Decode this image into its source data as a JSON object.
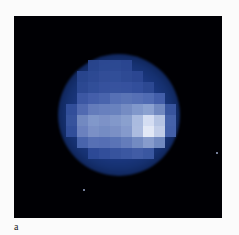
{
  "figure": {
    "panel_label": "a",
    "colors": {
      "background": "#000004",
      "disk_base": "#1d3a86",
      "band": "#7f95c9",
      "bright_spot": "#eef3ff",
      "page": "#fbfbfb"
    },
    "band_pixels": [
      {
        "x": 77,
        "y": 93,
        "c": "#3f5aa6"
      },
      {
        "x": 88,
        "y": 93,
        "c": "#4862ac"
      },
      {
        "x": 99,
        "y": 93,
        "c": "#4d67b0"
      },
      {
        "x": 110,
        "y": 93,
        "c": "#5b74b8"
      },
      {
        "x": 121,
        "y": 93,
        "c": "#5f78ba"
      },
      {
        "x": 132,
        "y": 93,
        "c": "#5b74b8"
      },
      {
        "x": 143,
        "y": 93,
        "c": "#5570b6"
      },
      {
        "x": 154,
        "y": 93,
        "c": "#4662ac"
      },
      {
        "x": 66,
        "y": 104,
        "c": "#34509c"
      },
      {
        "x": 77,
        "y": 104,
        "c": "#566fb4"
      },
      {
        "x": 88,
        "y": 104,
        "c": "#6a81bf"
      },
      {
        "x": 99,
        "y": 104,
        "c": "#6f86c2"
      },
      {
        "x": 110,
        "y": 104,
        "c": "#7088c2"
      },
      {
        "x": 121,
        "y": 104,
        "c": "#7d93c8"
      },
      {
        "x": 132,
        "y": 104,
        "c": "#8aa0d0"
      },
      {
        "x": 143,
        "y": 104,
        "c": "#95aad6"
      },
      {
        "x": 154,
        "y": 104,
        "c": "#7890c6"
      },
      {
        "x": 165,
        "y": 104,
        "c": "#3c58a2"
      },
      {
        "x": 66,
        "y": 115,
        "c": "#3a56a0"
      },
      {
        "x": 77,
        "y": 115,
        "c": "#7a90c6"
      },
      {
        "x": 88,
        "y": 115,
        "c": "#8a9fcf"
      },
      {
        "x": 99,
        "y": 115,
        "c": "#8599cc"
      },
      {
        "x": 110,
        "y": 115,
        "c": "#8b9fcf"
      },
      {
        "x": 121,
        "y": 115,
        "c": "#94a8d4"
      },
      {
        "x": 132,
        "y": 115,
        "c": "#b6c6e6"
      },
      {
        "x": 143,
        "y": 115,
        "c": "#e4ecfb"
      },
      {
        "x": 154,
        "y": 115,
        "c": "#c2d0ec"
      },
      {
        "x": 165,
        "y": 115,
        "c": "#4a66ae"
      },
      {
        "x": 66,
        "y": 126,
        "c": "#34509c"
      },
      {
        "x": 77,
        "y": 126,
        "c": "#7288c3"
      },
      {
        "x": 88,
        "y": 126,
        "c": "#8398cb"
      },
      {
        "x": 99,
        "y": 126,
        "c": "#7d93c8"
      },
      {
        "x": 110,
        "y": 126,
        "c": "#8397ca"
      },
      {
        "x": 121,
        "y": 126,
        "c": "#8ea2d1"
      },
      {
        "x": 132,
        "y": 126,
        "c": "#b8c7e6"
      },
      {
        "x": 143,
        "y": 126,
        "c": "#f3f7ff"
      },
      {
        "x": 154,
        "y": 126,
        "c": "#cfdaf1"
      },
      {
        "x": 165,
        "y": 126,
        "c": "#4864ac"
      },
      {
        "x": 77,
        "y": 137,
        "c": "#4d68b0"
      },
      {
        "x": 88,
        "y": 137,
        "c": "#5c75b8"
      },
      {
        "x": 99,
        "y": 137,
        "c": "#5a73b7"
      },
      {
        "x": 110,
        "y": 137,
        "c": "#5f78ba"
      },
      {
        "x": 121,
        "y": 137,
        "c": "#6a82bf"
      },
      {
        "x": 132,
        "y": 137,
        "c": "#7b92c7"
      },
      {
        "x": 143,
        "y": 137,
        "c": "#90a5d3"
      },
      {
        "x": 154,
        "y": 137,
        "c": "#7a91c7"
      },
      {
        "x": 88,
        "y": 148,
        "c": "#2f4b98"
      },
      {
        "x": 99,
        "y": 148,
        "c": "#34509c"
      },
      {
        "x": 110,
        "y": 148,
        "c": "#3a56a0"
      },
      {
        "x": 121,
        "y": 148,
        "c": "#3e5aa4"
      },
      {
        "x": 132,
        "y": 148,
        "c": "#4460a8"
      },
      {
        "x": 143,
        "y": 148,
        "c": "#3e5aa4"
      }
    ],
    "upper_pixels": [
      {
        "x": 88,
        "y": 60,
        "c": "#2a468f"
      },
      {
        "x": 99,
        "y": 60,
        "c": "#2f4b95"
      },
      {
        "x": 110,
        "y": 60,
        "c": "#2f4b95"
      },
      {
        "x": 121,
        "y": 60,
        "c": "#2c4893"
      },
      {
        "x": 77,
        "y": 71,
        "c": "#2a468f"
      },
      {
        "x": 88,
        "y": 71,
        "c": "#2f4b95"
      },
      {
        "x": 99,
        "y": 71,
        "c": "#344f99"
      },
      {
        "x": 110,
        "y": 71,
        "c": "#33509a"
      },
      {
        "x": 121,
        "y": 71,
        "c": "#304c96"
      },
      {
        "x": 132,
        "y": 71,
        "c": "#2c4893"
      },
      {
        "x": 77,
        "y": 82,
        "c": "#2e4a94"
      },
      {
        "x": 88,
        "y": 82,
        "c": "#33509a"
      },
      {
        "x": 99,
        "y": 82,
        "c": "#38549e"
      },
      {
        "x": 110,
        "y": 82,
        "c": "#3955a0"
      },
      {
        "x": 121,
        "y": 82,
        "c": "#3854a0"
      },
      {
        "x": 132,
        "y": 82,
        "c": "#34509c"
      },
      {
        "x": 143,
        "y": 82,
        "c": "#2e4a94"
      }
    ],
    "moons": [
      {
        "x": 69,
        "y": 173
      },
      {
        "x": 202,
        "y": 136
      }
    ]
  }
}
